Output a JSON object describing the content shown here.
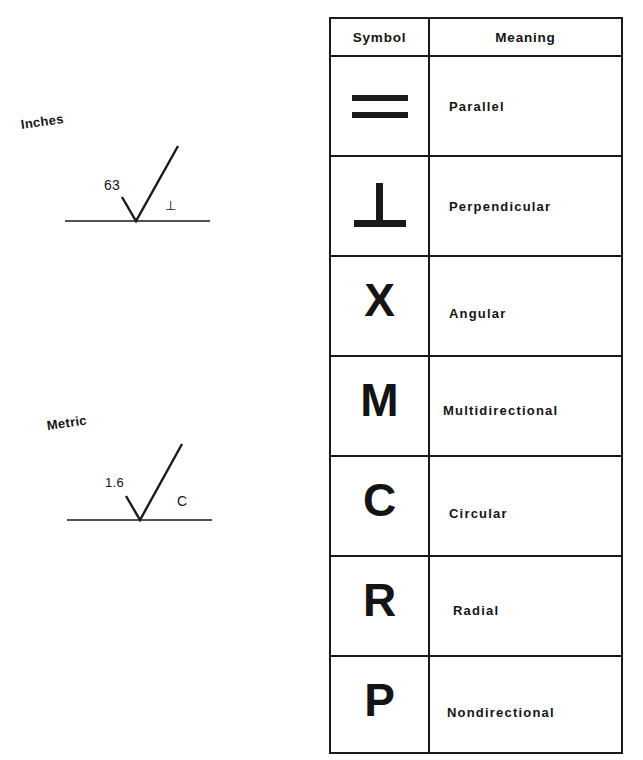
{
  "examples": [
    {
      "system_label": "Inches",
      "roughness_value": "63",
      "lay_symbol": "⊥"
    },
    {
      "system_label": "Metric",
      "roughness_value": "1.6",
      "lay_symbol": "C"
    }
  ],
  "table": {
    "headers": {
      "symbol": "Symbol",
      "meaning": "Meaning"
    },
    "rows": [
      {
        "symbol": "=",
        "symbol_type": "parallel-lines",
        "meaning": "Parallel"
      },
      {
        "symbol": "⊥",
        "symbol_type": "perpendicular",
        "meaning": "Perpendicular"
      },
      {
        "symbol": "X",
        "symbol_type": "letter",
        "meaning": "Angular"
      },
      {
        "symbol": "M",
        "symbol_type": "letter",
        "meaning": "Multidirectional"
      },
      {
        "symbol": "C",
        "symbol_type": "letter",
        "meaning": "Circular"
      },
      {
        "symbol": "R",
        "symbol_type": "letter",
        "meaning": "Radial"
      },
      {
        "symbol": "P",
        "symbol_type": "letter",
        "meaning": "Nondirectional"
      }
    ]
  }
}
